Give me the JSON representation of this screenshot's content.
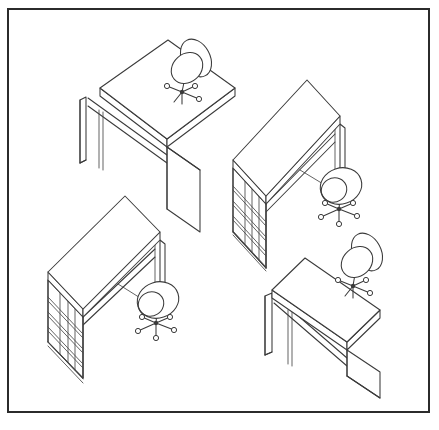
{
  "document": {
    "title": "Office Desk and Chair Workstations",
    "subtitle": "Isometric line drawing",
    "medium": "black and white technical line art",
    "background_color": "#ffffff",
    "ink_color": "#3a3a3a",
    "width": 439,
    "height": 430
  },
  "frame": {
    "name": "border-frame",
    "x": 8,
    "y": 9,
    "width": 421,
    "height": 403,
    "stroke_color": "#2b2b2b",
    "stroke_width": 2,
    "fill": "#ffffff"
  },
  "scene": {
    "projection": "isometric",
    "workstation_count": 4,
    "chair_count": 4,
    "desk_count": 4,
    "layout": "two by two grid of workstations"
  },
  "workstations": [
    {
      "id": "workstation-top-left",
      "label": "Top left workstation",
      "desk_type": "panel leg desk",
      "has_pedestal": false,
      "drawer_count": 0,
      "chair_view": "rear three quarter, backrest visible",
      "chair_position": "far right of desk",
      "desk": {
        "top": "100,88 168,40 235,88 167,139",
        "front_edge": "100,88 100,96 167,147 167,139",
        "right_edge": "167,139 167,147 235,96 235,88",
        "left_panel": "80,100 86,97 86,160 80,163",
        "left_panel_back": "80,100 80,163",
        "right_panel": "167,147 200,170 200,232 167,209",
        "right_panel_outline": "167,147 200,170",
        "right_panel_front": "167,209 167,147",
        "apron_top": "88,98 167,155",
        "apron_bottom": "88,106 167,163",
        "leg_inner": "103,112 103,170",
        "leg_inner_b": "99,110 99,168",
        "panel_foot": "80,163 86,160"
      },
      "chair": {
        "seat_cx": 187,
        "seat_cy": 68,
        "seat_rx": 17,
        "seat_ry": 14,
        "seat_rotate": -42,
        "back_cx": 196,
        "back_cy": 58,
        "back_rx": 14,
        "back_ry": 20,
        "back_rotate": -28,
        "hub_x": 182,
        "hub_y": 92,
        "spokes": [
          {
            "x": 167,
            "y": 86,
            "caster": true
          },
          {
            "x": 195,
            "y": 86,
            "caster": true
          },
          {
            "x": 199,
            "y": 99,
            "caster": true
          },
          {
            "x": 174,
            "y": 102,
            "caster": false
          },
          {
            "x": 182,
            "y": 104,
            "caster": false
          }
        ]
      }
    },
    {
      "id": "workstation-top-right",
      "label": "Top right workstation",
      "desk_type": "pedestal desk",
      "has_pedestal": true,
      "drawer_count": 4,
      "chair_view": "top down, seat visible",
      "chair_position": "front right of desk",
      "desk": {
        "top": "233,160 307,80 340,116 266,196",
        "front_edge": "233,160 233,168 266,204 266,196",
        "right_edge": "266,196 266,204 340,124 340,116",
        "pedestal": "233,168 266,204 266,268 233,232",
        "pedestal_left": "233,168 233,232",
        "pedestal_bottom": "233,232 266,268",
        "pedestal_right": "266,204 266,268",
        "drawers": [
          "245,180 245,244",
          "252,188 252,252",
          "259,196 259,260",
          "266,204 266,268"
        ],
        "drawer_lines": [
          "233,186 266,222",
          "233,201 266,237",
          "233,216 266,252",
          "233,231 266,267"
        ],
        "drawer_lines_b": [
          "233,190 266,226",
          "233,205 266,241",
          "233,220 266,256",
          "233,235 266,271"
        ],
        "right_leg": "340,124 345,128 345,186 340,182",
        "right_leg_inner": "335,128 335,186",
        "apron_top": "266,204 335,134",
        "apron_bottom": "266,212 335,142",
        "stretcher": "300,170 343,196"
      },
      "chair": {
        "seat_cx": 341,
        "seat_cy": 186,
        "seat_rx": 21,
        "seat_ry": 18,
        "seat_rotate": -18,
        "seat_inner_cx": 334,
        "seat_inner_cy": 190,
        "seat_inner_rx": 13,
        "seat_inner_ry": 12,
        "seat_inner_rotate": -32,
        "hub_x": 339,
        "hub_y": 209,
        "spokes": [
          {
            "x": 325,
            "y": 203,
            "caster": true
          },
          {
            "x": 353,
            "y": 203,
            "caster": true
          },
          {
            "x": 357,
            "y": 216,
            "caster": true
          },
          {
            "x": 321,
            "y": 217,
            "caster": true
          },
          {
            "x": 339,
            "y": 224,
            "caster": true
          }
        ]
      }
    },
    {
      "id": "workstation-bottom-left",
      "label": "Bottom left workstation",
      "desk_type": "pedestal desk",
      "has_pedestal": true,
      "drawer_count": 4,
      "chair_view": "top down, seat visible",
      "chair_position": "front right of desk",
      "desk": {
        "top": "48,272 125,196 160,232 83,309",
        "front_edge": "48,272 48,280 83,317 83,309",
        "right_edge": "83,309 83,317 160,240 160,232",
        "pedestal": "48,280 83,317 83,378 48,342",
        "pedestal_left": "48,280 48,342",
        "pedestal_bottom": "48,342 83,378",
        "pedestal_right": "83,317 83,378",
        "drawers": [
          "60,292 60,354",
          "68,300 68,362",
          "75,308 75,370",
          "83,317 83,378"
        ],
        "drawer_lines": [
          "48,297 83,334",
          "48,312 83,349",
          "48,327 83,364",
          "48,342 83,379"
        ],
        "drawer_lines_b": [
          "48,301 83,338",
          "48,316 83,353",
          "48,331 83,368",
          "48,346 83,383"
        ],
        "right_leg": "160,240 165,244 165,300 160,296",
        "right_leg_inner": "155,244 155,300",
        "apron_top": "83,317 155,249",
        "apron_bottom": "83,325 155,257",
        "stretcher": "118,284 161,311"
      },
      "chair": {
        "seat_cx": 158,
        "seat_cy": 300,
        "seat_rx": 21,
        "seat_ry": 18,
        "seat_rotate": -18,
        "seat_inner_cx": 151,
        "seat_inner_cy": 304,
        "seat_inner_rx": 13,
        "seat_inner_ry": 12,
        "seat_inner_rotate": -32,
        "hub_x": 156,
        "hub_y": 323,
        "spokes": [
          {
            "x": 142,
            "y": 317,
            "caster": true
          },
          {
            "x": 170,
            "y": 317,
            "caster": true
          },
          {
            "x": 174,
            "y": 330,
            "caster": true
          },
          {
            "x": 138,
            "y": 331,
            "caster": true
          },
          {
            "x": 156,
            "y": 338,
            "caster": true
          }
        ]
      }
    },
    {
      "id": "workstation-bottom-right",
      "label": "Bottom right workstation",
      "desk_type": "panel leg desk",
      "has_pedestal": false,
      "drawer_count": 0,
      "chair_view": "rear three quarter, backrest visible",
      "chair_position": "far right of desk",
      "desk": {
        "top": "272,290 305,258 380,310 347,342",
        "front_edge": "272,290 272,298 347,350 347,342",
        "right_edge": "347,342 347,350 380,318 380,310",
        "left_panel": "265,296 272,293 272,352 265,355",
        "left_panel_back": "265,296 265,355",
        "right_panel": "347,350 380,372 380,398 347,376",
        "right_panel_front": "347,350 347,376",
        "apron_top": "274,295 347,358",
        "apron_bottom": "274,303 347,366",
        "leg_inner": "292,312 292,366",
        "leg_inner_b": "288,310 288,364",
        "panel_foot": "265,355 272,352",
        "panel_right_long": "347,376 380,398"
      },
      "chair": {
        "seat_cx": 357,
        "seat_cy": 262,
        "seat_rx": 17,
        "seat_ry": 14,
        "seat_rotate": -42,
        "back_cx": 367,
        "back_cy": 252,
        "back_rx": 14,
        "back_ry": 20,
        "back_rotate": -28,
        "hub_x": 353,
        "hub_y": 286,
        "spokes": [
          {
            "x": 338,
            "y": 280,
            "caster": true
          },
          {
            "x": 366,
            "y": 280,
            "caster": true
          },
          {
            "x": 370,
            "y": 293,
            "caster": true
          },
          {
            "x": 345,
            "y": 296,
            "caster": false
          },
          {
            "x": 353,
            "y": 298,
            "caster": false
          }
        ]
      }
    }
  ],
  "caster_radius": 2.6,
  "hub_radius": 2.2
}
